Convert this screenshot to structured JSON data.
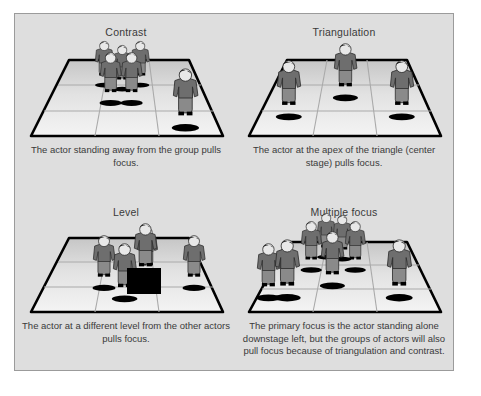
{
  "figure": {
    "background_color": "#ffffff",
    "panel_color": "#dedede",
    "panel_border_color": "#9b9b9b",
    "text_color": "#3a3a3a",
    "stage_outline_color": "#000000",
    "actor_shirt_color": "#6e6e6e",
    "actor_pants_color": "#8a8a8a",
    "actor_hair_color": "#1a1a1a",
    "actor_face_color": "#e8e8e8",
    "actor_shoe_color": "#000000",
    "platform_box_color": "#000000"
  },
  "panels": [
    {
      "id": "contrast",
      "title": "Contrast",
      "caption": "The actor standing away from the group pulls focus.",
      "actors": [
        {
          "x": 86,
          "y": 34,
          "scale": 1.0,
          "row": "back"
        },
        {
          "x": 104,
          "y": 40,
          "scale": 1.04,
          "row": "back"
        },
        {
          "x": 122,
          "y": 34,
          "scale": 1.0,
          "row": "back"
        },
        {
          "x": 93,
          "y": 50,
          "scale": 1.16,
          "row": "mid"
        },
        {
          "x": 114,
          "y": 50,
          "scale": 1.16,
          "row": "mid"
        },
        {
          "x": 171,
          "y": 56,
          "scale": 1.3,
          "row": "front"
        }
      ],
      "platform": null
    },
    {
      "id": "triangulation",
      "title": "Triangulation",
      "caption": "The actor at the apex of the triangle (center stage) pulls focus.",
      "actors": [
        {
          "x": 109,
          "y": 44,
          "scale": 1.12,
          "row": "mid"
        },
        {
          "x": 50,
          "y": 58,
          "scale": 1.18,
          "row": "front"
        },
        {
          "x": 168,
          "y": 58,
          "scale": 1.18,
          "row": "front"
        }
      ],
      "platform": null
    },
    {
      "id": "level",
      "title": "Level",
      "caption": "The actor at a different level from the other actors pulls focus.",
      "actors": [
        {
          "x": 132,
          "y": 38,
          "scale": 1.06,
          "row": "back"
        },
        {
          "x": 109,
          "y": 48,
          "scale": 1.12,
          "row": "mid"
        },
        {
          "x": 152,
          "y": 56,
          "scale": 1.16,
          "row": "mid"
        },
        {
          "x": 88,
          "y": 54,
          "scale": 1.18,
          "row": "mid"
        },
        {
          "x": 178,
          "y": 48,
          "scale": 1.12,
          "row": "mid"
        }
      ],
      "platform": {
        "x": 122,
        "y": 74,
        "width": 30,
        "height": 24
      },
      "elevated_actor": {
        "x": 137,
        "y": 25,
        "scale": 1.18
      }
    },
    {
      "id": "multiple",
      "title": "Multiple focus",
      "caption": "The primary focus is the actor standing alone downstage left, but the groups of actors will also pull focus because of triangulation and contrast.",
      "actors": [
        {
          "x": 88,
          "y": 24,
          "scale": 0.98,
          "row": "back"
        },
        {
          "x": 104,
          "y": 26,
          "scale": 0.98,
          "row": "back"
        },
        {
          "x": 72,
          "y": 34,
          "scale": 1.06,
          "row": "back"
        },
        {
          "x": 116,
          "y": 34,
          "scale": 1.06,
          "row": "back"
        },
        {
          "x": 94,
          "y": 44,
          "scale": 1.16,
          "row": "mid"
        },
        {
          "x": 20,
          "y": 54,
          "scale": 1.2,
          "row": "front"
        },
        {
          "x": 38,
          "y": 50,
          "scale": 1.26,
          "row": "front"
        },
        {
          "x": 166,
          "y": 52,
          "scale": 1.26,
          "row": "front"
        }
      ],
      "platform": null
    }
  ]
}
